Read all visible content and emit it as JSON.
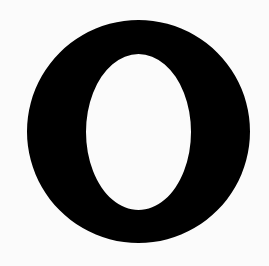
{
  "image": {
    "glyph": "O",
    "description": "Bold black capital letter O on white background"
  },
  "colors": {
    "background": "#fbfbfb",
    "glyph": "#000000"
  }
}
